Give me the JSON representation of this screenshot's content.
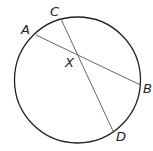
{
  "diagram": {
    "type": "circle-with-intersecting-chords",
    "circle": {
      "cx": 77.5,
      "cy": 80,
      "r": 63
    },
    "chords": [
      {
        "name": "AB",
        "from": "A",
        "to": "B"
      },
      {
        "name": "CD",
        "from": "C",
        "to": "D"
      }
    ],
    "points": {
      "A": {
        "label": "A",
        "x": 36,
        "y": 35
      },
      "B": {
        "label": "B",
        "x": 140.5,
        "y": 85
      },
      "C": {
        "label": "C",
        "x": 61,
        "y": 19
      },
      "D": {
        "label": "D",
        "x": 113,
        "y": 131
      },
      "X": {
        "label": "X",
        "x": 77,
        "y": 53
      }
    },
    "colors": {
      "circle": "#222222",
      "chord": "#555555",
      "label": "#222222"
    }
  }
}
